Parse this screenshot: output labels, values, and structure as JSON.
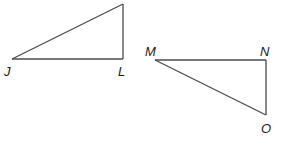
{
  "diagram": {
    "triangles": [
      {
        "name": "triangle-JL",
        "vertices": [
          {
            "id": "J",
            "label": "J"
          },
          {
            "id": "L",
            "label": "L"
          },
          {
            "id": "top",
            "label": ""
          }
        ],
        "right_angle_at": "L"
      },
      {
        "name": "triangle-MNO",
        "vertices": [
          {
            "id": "M",
            "label": "M"
          },
          {
            "id": "N",
            "label": "N"
          },
          {
            "id": "O",
            "label": "O"
          }
        ],
        "right_angle_at": "N"
      }
    ],
    "colors": {
      "line": "#4a4a4a",
      "label": "#1a1a1a",
      "background": "#ffffff"
    }
  }
}
